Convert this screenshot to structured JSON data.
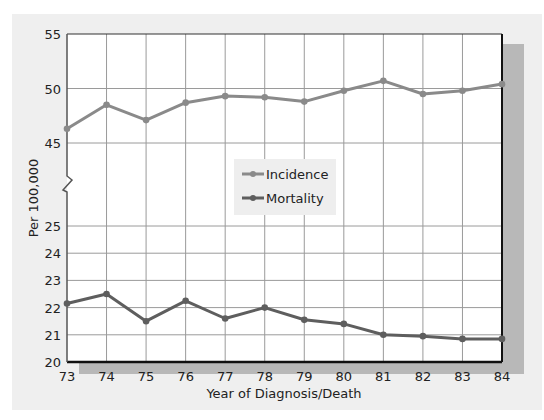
{
  "chart_data": {
    "type": "line",
    "title": "",
    "xlabel": "Year of Diagnosis/Death",
    "ylabel": "Per 100,000",
    "x": [
      "73",
      "74",
      "75",
      "76",
      "77",
      "78",
      "79",
      "80",
      "81",
      "82",
      "83",
      "84"
    ],
    "series": [
      {
        "name": "Incidence",
        "color": "#8a8a8a",
        "values": [
          46.3,
          48.5,
          47.1,
          48.7,
          49.3,
          49.2,
          48.8,
          49.8,
          50.7,
          49.5,
          49.8,
          50.4
        ]
      },
      {
        "name": "Mortality",
        "color": "#5e5e5e",
        "values": [
          22.15,
          22.5,
          21.5,
          22.25,
          21.6,
          22.0,
          21.55,
          21.4,
          21.0,
          20.95,
          20.85,
          20.85
        ]
      }
    ],
    "y_axis": {
      "broken": true,
      "upper_segment": {
        "range": [
          45,
          55
        ],
        "ticks": [
          "45",
          "50",
          "55"
        ]
      },
      "lower_segment": {
        "range": [
          20,
          25
        ],
        "ticks": [
          "20",
          "21",
          "22",
          "23",
          "24",
          "25"
        ]
      }
    },
    "grid": true,
    "legend": {
      "position": "center",
      "entries": [
        "Incidence",
        "Mortality"
      ]
    }
  },
  "colors": {
    "background_panel": "#efefef",
    "plot_bg": "#ffffff",
    "grid": "#9a9a9a",
    "axis": "#111111",
    "shadow": "#b8b8b8"
  }
}
